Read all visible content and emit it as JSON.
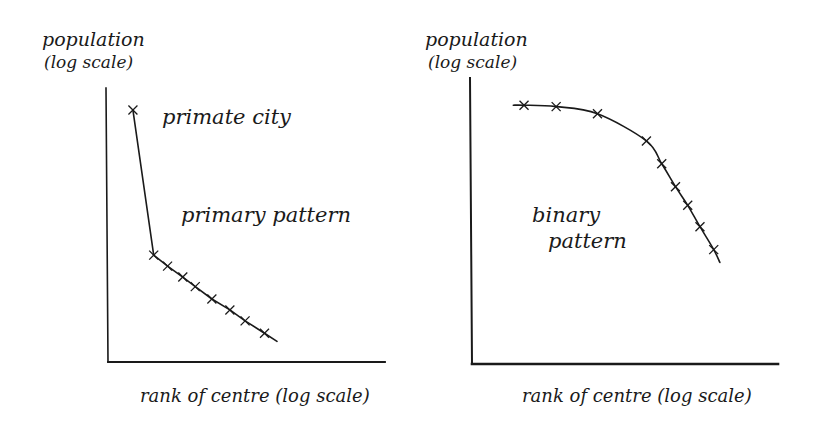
{
  "colors": {
    "ink": "#1a1a1a",
    "background": "#ffffff"
  },
  "chart_data": [
    {
      "type": "line",
      "title": "",
      "annotations": [
        "primate city",
        "primary pattern"
      ],
      "ylabel": "population (log scale)",
      "ylabel_lines": [
        "population",
        "(log scale)"
      ],
      "xlabel": "rank of centre (log scale)",
      "grid": false,
      "legend": null,
      "marker": "x",
      "note": "Schematic; no numeric ticks. Points are in relative units: x = rank position (0-100 across axis), y = height above x-axis (0-100 of axis).",
      "x": [
        9,
        16.5,
        21.5,
        27,
        31.5,
        37.5,
        44,
        49.5,
        56.5
      ],
      "y": [
        92,
        39,
        35,
        31,
        27.5,
        23,
        19,
        15,
        10.5
      ],
      "line_end": [
        61,
        7.5
      ]
    },
    {
      "type": "line",
      "title": "",
      "annotations": [
        "binary pattern"
      ],
      "annotation_lines": [
        "binary",
        "pattern"
      ],
      "ylabel": "population (log scale)",
      "ylabel_lines": [
        "population",
        "(log scale)"
      ],
      "xlabel": "rank of centre (log scale)",
      "grid": false,
      "legend": null,
      "marker": "x",
      "note": "Schematic; no numeric ticks. Smooth concave curve: flat then steep decline.",
      "x": [
        17,
        27.5,
        41,
        57,
        62,
        66.5,
        70.5,
        74.5,
        79
      ],
      "y": [
        90.5,
        90,
        87.5,
        78,
        70,
        62,
        55.5,
        48,
        40
      ],
      "line_start": [
        13.5,
        90.5
      ],
      "line_end": [
        81,
        35.5
      ]
    }
  ]
}
